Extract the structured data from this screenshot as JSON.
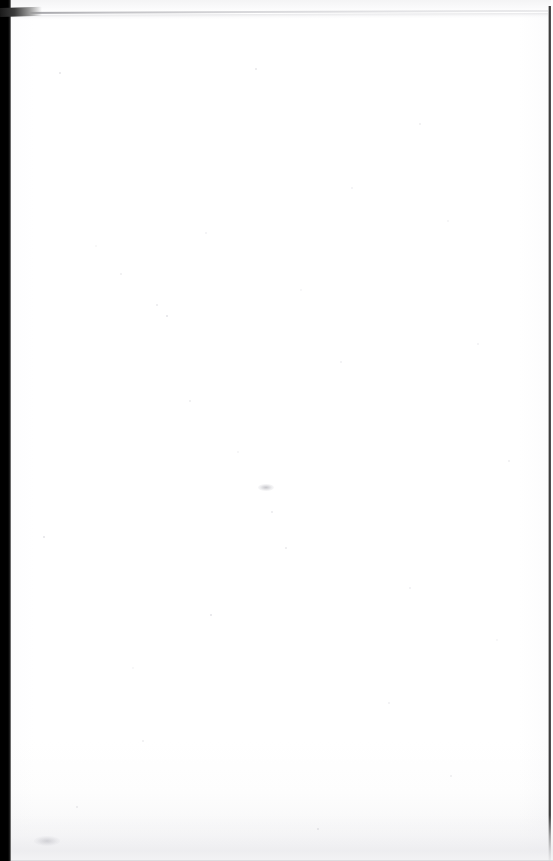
{
  "document": {
    "kind": "scanned-page-image",
    "page_label": "",
    "body_text": "",
    "visible_text_lines": [],
    "has_text": false,
    "has_figures": false,
    "has_tables": false,
    "description": "Blank scanned page — no printed text, figures, headers, footers or page number are rendered in the pixels."
  },
  "canvas": {
    "width_px": 553,
    "height_px": 861,
    "paper_color": "#ffffff",
    "background_color": "#ffffff"
  },
  "scan_artifacts": {
    "left_edge": {
      "name": "black-scan-border",
      "position": "left",
      "width_px": 11,
      "color": "#000000"
    },
    "right_edge": {
      "name": "thin-dark-border",
      "position": "right",
      "width_px": 3,
      "color": "#2d2d2d"
    },
    "top_rule": {
      "name": "diagonal-grey-line",
      "start_y_px": 13,
      "end_y_px": 11,
      "color": "#b9b9be",
      "angle_deg": -0.22
    },
    "corner_wedge": {
      "name": "top-left-dark-wedge",
      "color": "#1a1a1a"
    },
    "bottom_wash": {
      "name": "bottom-grey-gradient",
      "height_px": 46,
      "color": "#ececef"
    },
    "speckles": {
      "name": "sensor-dust-speckles",
      "color": "#c9c9cf",
      "points": [
        {
          "x": 96,
          "y": 246,
          "r": 1.1
        },
        {
          "x": 206,
          "y": 233,
          "r": 1.0
        },
        {
          "x": 121,
          "y": 274,
          "r": 0.9
        },
        {
          "x": 157,
          "y": 305,
          "r": 1.2
        },
        {
          "x": 167,
          "y": 316,
          "r": 0.8
        },
        {
          "x": 301,
          "y": 290,
          "r": 0.9
        },
        {
          "x": 341,
          "y": 362,
          "r": 0.8
        },
        {
          "x": 420,
          "y": 124,
          "r": 0.9
        },
        {
          "x": 256,
          "y": 69,
          "r": 0.8
        },
        {
          "x": 60,
          "y": 73,
          "r": 0.9
        },
        {
          "x": 448,
          "y": 221,
          "r": 0.8
        },
        {
          "x": 478,
          "y": 344,
          "r": 1.0
        },
        {
          "x": 509,
          "y": 461,
          "r": 0.9
        },
        {
          "x": 286,
          "y": 548,
          "r": 0.9
        },
        {
          "x": 211,
          "y": 615,
          "r": 0.8
        },
        {
          "x": 133,
          "y": 668,
          "r": 0.9
        },
        {
          "x": 389,
          "y": 703,
          "r": 0.8
        },
        {
          "x": 451,
          "y": 776,
          "r": 0.9
        },
        {
          "x": 77,
          "y": 807,
          "r": 1.0
        },
        {
          "x": 318,
          "y": 829,
          "r": 0.9
        },
        {
          "x": 238,
          "y": 452,
          "r": 0.8
        },
        {
          "x": 352,
          "y": 188,
          "r": 0.9
        },
        {
          "x": 190,
          "y": 401,
          "r": 0.8
        },
        {
          "x": 272,
          "y": 512,
          "r": 1.0
        },
        {
          "x": 44,
          "y": 537,
          "r": 0.8
        },
        {
          "x": 497,
          "y": 640,
          "r": 0.9
        },
        {
          "x": 410,
          "y": 588,
          "r": 0.8
        },
        {
          "x": 143,
          "y": 741,
          "r": 0.9
        }
      ]
    },
    "smudges": [
      {
        "name": "mid-page-smudge",
        "x": 258,
        "y": 484,
        "w": 16,
        "h": 7
      },
      {
        "name": "lower-left-smudge",
        "x": 34,
        "y": 836,
        "w": 26,
        "h": 10
      }
    ]
  }
}
